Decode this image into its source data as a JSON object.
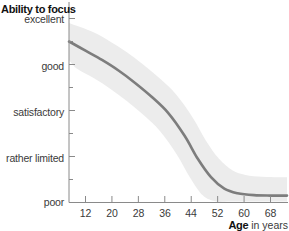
{
  "chart_data": {
    "type": "line",
    "title": "",
    "ylabel": "Ability to focus",
    "xlabel_bold": "Age",
    "xlabel_rest": " in years",
    "x_ticks": [
      12,
      20,
      28,
      36,
      44,
      52,
      60,
      68
    ],
    "y_ticks": [
      "poor",
      "rather limited",
      "satisfactory",
      "good",
      "excellent"
    ],
    "xlim": [
      7,
      73
    ],
    "ylim": [
      0,
      4
    ],
    "grid": false,
    "legend": null,
    "series": [
      {
        "name": "Ability to focus",
        "x": [
          7,
          12,
          17,
          22,
          27,
          32,
          37,
          42,
          46,
          50,
          54,
          58,
          63,
          68,
          73
        ],
        "y": [
          3.5,
          3.3,
          3.1,
          2.87,
          2.6,
          2.3,
          1.95,
          1.45,
          0.95,
          0.55,
          0.3,
          0.2,
          0.16,
          0.15,
          0.15
        ],
        "band_halfwidth": 0.4
      }
    ],
    "colors": {
      "line": "#7d7d7d",
      "band": "#ececec",
      "axis": "#8a8a8a"
    }
  },
  "labels": {
    "y_title": "Ability to focus",
    "x_title_bold": "Age",
    "x_title_rest": " in years",
    "y_excellent": "excellent",
    "y_good": "good",
    "y_satisfactory": "satisfactory",
    "y_rather_limited": "rather limited",
    "y_poor": "poor",
    "x_12": "12",
    "x_20": "20",
    "x_28": "28",
    "x_36": "36",
    "x_44": "44",
    "x_52": "52",
    "x_60": "60",
    "x_68": "68"
  }
}
